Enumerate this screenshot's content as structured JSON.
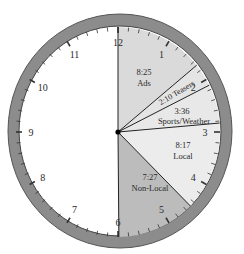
{
  "chart_data": {
    "type": "pie",
    "title": "",
    "style": "clock-face",
    "unit": "minutes:seconds of a 60-minute hour",
    "segments": [
      {
        "label": "Ads",
        "value_text": "8:25",
        "minutes": 8.4167,
        "color": "#dadada"
      },
      {
        "label": "Teasers",
        "value_text": "2:10",
        "minutes": 2.1667,
        "color": "#e4e4e4"
      },
      {
        "label": "Sports/Weather",
        "value_text": "3:36",
        "minutes": 3.6,
        "color": "#e8e8e8"
      },
      {
        "label": "Local",
        "value_text": "8:17",
        "minutes": 8.2833,
        "color": "#ececec"
      },
      {
        "label": "Non-Local",
        "value_text": "7:27",
        "minutes": 7.45,
        "color": "#bcbcbc"
      }
    ],
    "remainder_color": "#ffffff",
    "hour_labels": [
      "12",
      "1",
      "2",
      "3",
      "4",
      "5",
      "6",
      "7",
      "8",
      "9",
      "10",
      "11"
    ],
    "ring_color": "#8c8c8c"
  },
  "labels": {
    "ads_value": "8:25",
    "ads_name": "Ads",
    "teasers": "2:10 Teasers",
    "sports_value": "3:36",
    "sports_name": "Sports/Weather",
    "local_value": "8:17",
    "local_name": "Local",
    "nonlocal_value": "7:27",
    "nonlocal_name": "Non-Local"
  }
}
